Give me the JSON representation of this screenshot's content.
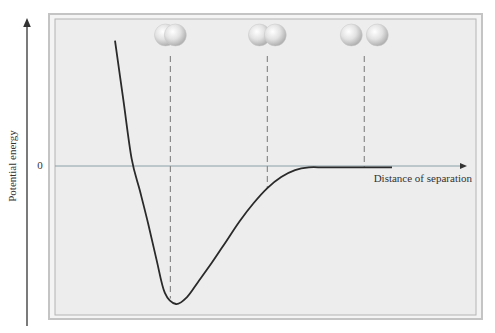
{
  "chart_data": {
    "type": "line",
    "title": "",
    "xlabel": "Distance of separation",
    "ylabel": "Potential energy",
    "y_tick_labels": [
      "0"
    ],
    "xlim": [
      0,
      1
    ],
    "ylim": [
      -1,
      0.35
    ],
    "series": [
      {
        "name": "potential-energy-curve",
        "x": [
          0.0,
          0.03,
          0.06,
          0.09,
          0.12,
          0.15,
          0.18,
          0.22,
          0.26,
          0.3,
          0.35,
          0.4,
          0.45,
          0.5,
          0.55,
          0.6,
          0.65,
          0.7,
          0.75,
          0.8,
          0.85,
          0.9,
          1.0
        ],
        "y": [
          0.34,
          0.18,
          0.02,
          -0.18,
          -0.42,
          -0.68,
          -0.92,
          -1.0,
          -0.95,
          -0.84,
          -0.7,
          -0.55,
          -0.4,
          -0.27,
          -0.16,
          -0.08,
          -0.03,
          -0.01,
          -0.01,
          -0.01,
          -0.01,
          -0.01,
          -0.01
        ]
      }
    ],
    "markers": [
      {
        "name": "overlapping-atoms",
        "x": 0.2,
        "overlap": 0.55
      },
      {
        "name": "bonding-atoms",
        "x": 0.55,
        "overlap": 0.28
      },
      {
        "name": "separated-atoms",
        "x": 0.9,
        "overlap": 0.0
      }
    ],
    "grid": false,
    "colors": {
      "curve": "#2a2a2a",
      "panel": "#ececec",
      "panel_border": "#b8b8b8",
      "zero_line": "#8aa0a8",
      "dashed": "#8a8a8a",
      "atom": "#d4d4d4"
    }
  }
}
